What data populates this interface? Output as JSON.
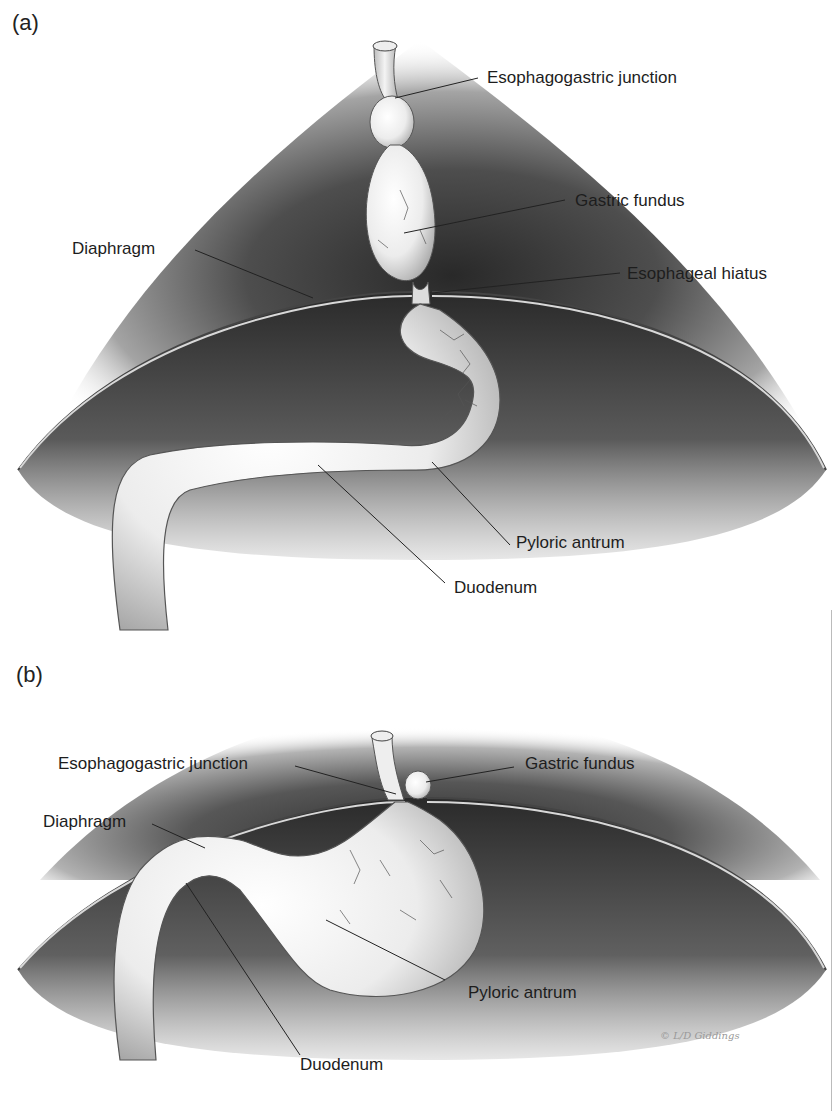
{
  "figure": {
    "panels": [
      {
        "id": "a",
        "label": "(a)",
        "labels": {
          "esophagogastric_junction": "Esophagogastric junction",
          "gastric_fundus": "Gastric fundus",
          "diaphragm": "Diaphragm",
          "esophageal_hiatus": "Esophageal hiatus",
          "pyloric_antrum": "Pyloric antrum",
          "duodenum": "Duodenum"
        }
      },
      {
        "id": "b",
        "label": "(b)",
        "labels": {
          "esophagogastric_junction": "Esophagogastric junction",
          "gastric_fundus": "Gastric fundus",
          "diaphragm": "Diaphragm",
          "pyloric_antrum": "Pyloric antrum",
          "duodenum": "Duodenum"
        }
      }
    ],
    "signature": "© L/D Giddings"
  }
}
